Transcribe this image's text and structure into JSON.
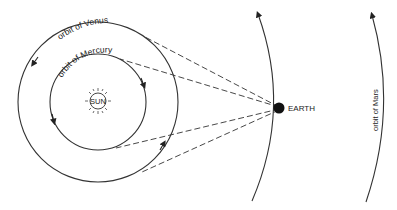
{
  "diagram": {
    "type": "solar-system-orbits",
    "colors": {
      "background": "#ffffff",
      "line": "#333333",
      "earth": "#111111"
    },
    "sun": {
      "label": "SUN",
      "cx": 98,
      "cy": 101
    },
    "orbits": [
      {
        "name": "mercury",
        "label": "orbit of Mercury",
        "radius": 48,
        "direction": "counter-clockwise"
      },
      {
        "name": "venus",
        "label": "orbit of Venus",
        "radius": 80,
        "direction": "counter-clockwise"
      },
      {
        "name": "earth",
        "label": "",
        "direction": "upward"
      },
      {
        "name": "mars",
        "label": "orbit of Mars",
        "direction": "upward"
      }
    ],
    "earth": {
      "label": "EARTH",
      "cx": 279,
      "cy": 108
    },
    "sight_lines": [
      {
        "to": "venus-top-tangent"
      },
      {
        "to": "mercury-top-tangent"
      },
      {
        "to": "mercury-bottom-tangent"
      },
      {
        "to": "venus-bottom-tangent"
      }
    ]
  }
}
